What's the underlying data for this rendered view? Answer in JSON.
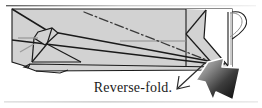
{
  "figure": {
    "name": "origami-reverse-fold-step",
    "caption": "Reverse-fold.",
    "background_color": "#ffffff",
    "border_color": "#9a9a9a",
    "paper": {
      "fill_color": "#d2d2d2",
      "highlight_fill_color": "#ffffff",
      "outline_color": "#1a1a1a",
      "crease_color": "#9b9b9b"
    },
    "fold_line": {
      "name": "valley-fold-dash-dot-line",
      "style": "dash-dot",
      "color": "#3a3a3a"
    },
    "motion_arrow": {
      "name": "motion-arrow-down-left",
      "style": "outline",
      "color": "#2a2a2a",
      "direction": "down-left"
    },
    "push_arrow": {
      "name": "push-arrow-up-left",
      "style": "filled-gradient",
      "gradient_from": "#c9c9c9",
      "gradient_to": "#0b0b0b",
      "outline_color": "#ffffff",
      "direction": "up-left"
    },
    "labels": {
      "figure_alt": "Paper airplane seen from the side with a reverse-fold indicated at the tail"
    }
  }
}
